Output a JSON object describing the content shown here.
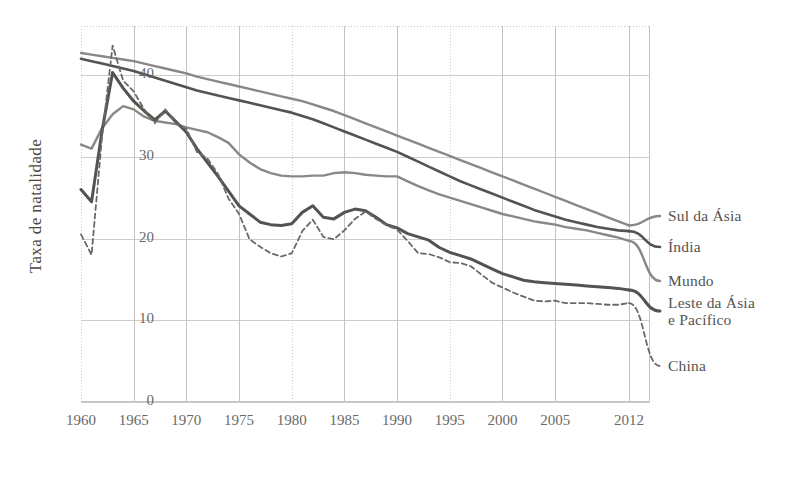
{
  "chart_data": {
    "type": "line",
    "title": "",
    "xlabel": "",
    "ylabel": "Taxa de natalidade",
    "xlim": [
      1960,
      2014
    ],
    "ylim": [
      0,
      46
    ],
    "xticks": [
      1960,
      1965,
      1970,
      1975,
      1980,
      1985,
      1990,
      1995,
      2000,
      2005,
      2012
    ],
    "yticks": [
      0,
      10,
      20,
      30,
      40
    ],
    "grid": true,
    "legend_position": "right-inline-labels",
    "x": [
      1960,
      1961,
      1962,
      1963,
      1964,
      1965,
      1966,
      1967,
      1968,
      1969,
      1970,
      1971,
      1972,
      1973,
      1974,
      1975,
      1976,
      1977,
      1978,
      1979,
      1980,
      1981,
      1982,
      1983,
      1984,
      1985,
      1986,
      1987,
      1988,
      1989,
      1990,
      1991,
      1992,
      1993,
      1994,
      1995,
      1996,
      1997,
      1998,
      1999,
      2000,
      2001,
      2002,
      2003,
      2004,
      2005,
      2006,
      2007,
      2008,
      2009,
      2010,
      2011,
      2012
    ],
    "series": [
      {
        "name": "Sul da Ásia",
        "color": "#8a8885",
        "style": "solid",
        "width": 2.4,
        "values": [
          42.7,
          42.5,
          42.3,
          42.1,
          41.9,
          41.7,
          41.4,
          41.1,
          40.8,
          40.5,
          40.2,
          39.8,
          39.5,
          39.2,
          38.9,
          38.6,
          38.3,
          38.0,
          37.7,
          37.4,
          37.1,
          36.8,
          36.4,
          36.0,
          35.6,
          35.1,
          34.6,
          34.1,
          33.6,
          33.1,
          32.6,
          32.1,
          31.6,
          31.1,
          30.6,
          30.1,
          29.6,
          29.1,
          28.6,
          28.1,
          27.6,
          27.1,
          26.6,
          26.1,
          25.6,
          25.1,
          24.6,
          24.1,
          23.6,
          23.1,
          22.6,
          22.1,
          21.6
        ]
      },
      {
        "name": "Índia",
        "color": "#55534f",
        "style": "solid",
        "width": 2.6,
        "values": [
          42.0,
          41.7,
          41.4,
          41.1,
          40.8,
          40.5,
          40.1,
          39.7,
          39.3,
          38.9,
          38.5,
          38.1,
          37.8,
          37.5,
          37.2,
          36.9,
          36.6,
          36.3,
          36.0,
          35.7,
          35.4,
          35.0,
          34.6,
          34.1,
          33.6,
          33.1,
          32.6,
          32.1,
          31.6,
          31.1,
          30.6,
          30.0,
          29.4,
          28.8,
          28.2,
          27.6,
          27.0,
          26.5,
          26.0,
          25.5,
          25.0,
          24.5,
          24.0,
          23.5,
          23.1,
          22.7,
          22.3,
          22.0,
          21.7,
          21.4,
          21.2,
          21.0,
          20.9
        ]
      },
      {
        "name": "Mundo",
        "color": "#8a8885",
        "style": "solid",
        "width": 2.4,
        "values": [
          31.5,
          31.0,
          33.5,
          35.2,
          36.2,
          35.8,
          34.9,
          34.4,
          34.2,
          34.0,
          33.6,
          33.3,
          33.0,
          32.4,
          31.7,
          30.3,
          29.3,
          28.5,
          28.0,
          27.7,
          27.6,
          27.6,
          27.7,
          27.7,
          28.0,
          28.1,
          28.0,
          27.8,
          27.7,
          27.6,
          27.6,
          27.0,
          26.4,
          25.9,
          25.4,
          25.0,
          24.6,
          24.2,
          23.8,
          23.4,
          23.0,
          22.7,
          22.4,
          22.1,
          21.9,
          21.7,
          21.4,
          21.2,
          21.0,
          20.7,
          20.4,
          20.1,
          19.7
        ]
      },
      {
        "name": "Leste da Ásia\ne Pacífico",
        "color": "#55534f",
        "style": "solid",
        "width": 3.0,
        "values": [
          26.0,
          24.5,
          33.2,
          40.3,
          38.4,
          36.8,
          35.6,
          34.5,
          35.6,
          34.3,
          33.0,
          31.0,
          29.3,
          27.6,
          25.8,
          24.0,
          23.0,
          22.0,
          21.7,
          21.6,
          21.8,
          23.2,
          24.0,
          22.6,
          22.4,
          23.2,
          23.6,
          23.4,
          22.6,
          21.7,
          21.3,
          20.6,
          20.2,
          19.8,
          18.9,
          18.3,
          17.9,
          17.5,
          16.9,
          16.3,
          15.7,
          15.3,
          14.9,
          14.7,
          14.6,
          14.5,
          14.4,
          14.3,
          14.2,
          14.1,
          14.0,
          13.9,
          13.7
        ]
      },
      {
        "name": "China",
        "color": "#6b6967",
        "style": "dashed",
        "width": 1.8,
        "values": [
          20.5,
          18.0,
          32.5,
          43.6,
          39.3,
          38.0,
          35.8,
          34.1,
          35.8,
          34.1,
          33.4,
          30.6,
          29.8,
          27.9,
          24.9,
          23.0,
          19.9,
          19.0,
          18.2,
          17.8,
          18.2,
          20.9,
          22.3,
          20.2,
          19.9,
          21.0,
          22.4,
          23.3,
          22.4,
          21.6,
          21.1,
          19.7,
          18.2,
          18.1,
          17.7,
          17.1,
          17.0,
          16.6,
          15.6,
          14.6,
          14.0,
          13.4,
          12.9,
          12.4,
          12.3,
          12.4,
          12.1,
          12.1,
          12.1,
          12.0,
          11.9,
          11.9,
          12.1
        ]
      }
    ]
  },
  "axis": {
    "y_title": "Taxa de natalidade",
    "y_ticks": [
      "40",
      "30",
      "20",
      "10",
      "0"
    ],
    "x_ticks": [
      "1960",
      "1965",
      "1970",
      "1975",
      "1980",
      "1985",
      "1990",
      "1995",
      "2000",
      "2005",
      "2012"
    ]
  },
  "legend": {
    "items": [
      {
        "label": "Sul da Ásia"
      },
      {
        "label": "Índia"
      },
      {
        "label": "Mundo"
      },
      {
        "label": "Leste da Ásia\ne Pacífico"
      },
      {
        "label": "China"
      }
    ]
  }
}
